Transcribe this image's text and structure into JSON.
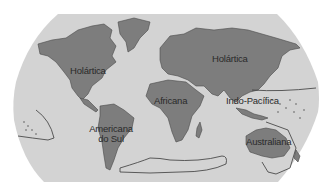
{
  "map": {
    "title": "Regiões biogeográficas",
    "colors": {
      "background": "#ffffff",
      "ocean": "#d3d3d3",
      "land": "#7d7d7d",
      "outline": "#3a3a3a",
      "label": "#2a2a2a"
    },
    "regions": [
      {
        "id": "holartica-americas",
        "label": "Holártica"
      },
      {
        "id": "holartica-eurasia",
        "label": "Holártica"
      },
      {
        "id": "africana",
        "label": "Africana"
      },
      {
        "id": "indo-pacifica",
        "label": "Indo-Pacífica"
      },
      {
        "id": "americana-do-sul",
        "label_line1": "Americana",
        "label_line2": "do Sul"
      },
      {
        "id": "australiana",
        "label": "Australiana"
      }
    ]
  }
}
